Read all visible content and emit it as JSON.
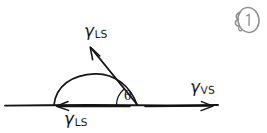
{
  "figure": {
    "width": 267,
    "height": 133,
    "background_color": "#ffffff",
    "ink_color": "#141414",
    "style": "hand-drawn sketch"
  },
  "labels": {
    "gamma_ls_tangent": {
      "symbol": "γ",
      "subscript": "LS",
      "meaning": "liquid-solid interfacial tension (tangent to droplet)",
      "x": 84,
      "y": 22
    },
    "gamma_ls_baseline": {
      "symbol": "γ",
      "subscript": "LS",
      "meaning": "liquid-solid interfacial tension (along surface, leftward)",
      "x": 64,
      "y": 110
    },
    "gamma_vs": {
      "symbol": "γ",
      "subscript": "VS",
      "meaning": "vapour-solid interfacial tension (along surface, rightward)",
      "x": 190,
      "y": 78
    },
    "theta": {
      "symbol": "θ",
      "meaning": "contact angle",
      "x": 124,
      "y": 90
    }
  },
  "geometry": {
    "baseline": {
      "x1": 5,
      "y1": 105,
      "x2": 218,
      "y2": 105
    },
    "droplet_arc": {
      "left_contact_x": 54,
      "right_contact_x": 137,
      "apex_x": 95,
      "apex_y": 74
    },
    "arrow_left": {
      "from_x": 130,
      "from_y": 105,
      "to_x": 57,
      "to_y": 105,
      "direction": "left"
    },
    "arrow_right": {
      "from_x": 145,
      "from_y": 105,
      "to_x": 213,
      "to_y": 105,
      "direction": "right"
    },
    "arrow_tangent": {
      "from_x": 137,
      "from_y": 105,
      "to_x": 90,
      "to_y": 47,
      "direction": "up-left"
    },
    "angle_arc": {
      "center_x": 137,
      "center_y": 105,
      "radius": 22
    }
  },
  "annotation": {
    "page_mark": {
      "text": "1",
      "description": "hand-drawn circled page number with squiggle flourish",
      "x": 232,
      "y": 4
    }
  }
}
